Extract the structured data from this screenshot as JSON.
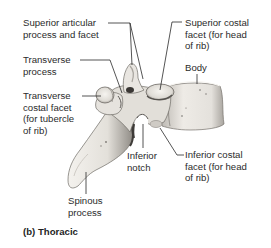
{
  "figure": {
    "caption": "(b) Thoracic",
    "labels": {
      "superior_articular": "Superior articular\nprocess and facet",
      "transverse_process": "Transverse\nprocess",
      "transverse_costal_facet": "Transverse\ncostal facet\n(for tubercle\nof rib)",
      "superior_costal_facet": "Superior costal\nfacet (for head\nof rib)",
      "body": "Body",
      "inferior_notch": "Inferior\nnotch",
      "inferior_costal_facet": "Inferior costal\nfacet (for head\nof rib)",
      "spinous_process": "Spinous\nprocess"
    },
    "colors": {
      "bone_light": "#f2f0ec",
      "bone_mid": "#d6d3cd",
      "bone_shadow": "#8f8b85",
      "bone_dark": "#4a4744",
      "leader_line": "#2a2a2a",
      "text": "#2b2b2b"
    }
  }
}
